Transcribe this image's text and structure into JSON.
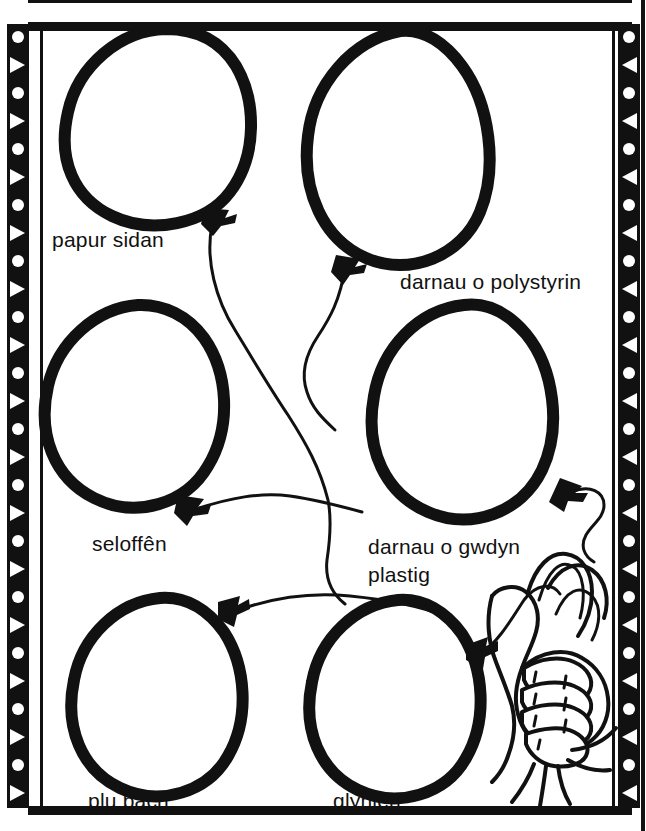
{
  "page": {
    "language": "cy",
    "background_color": "#ffffff",
    "ink_color": "#111111"
  },
  "frame": {
    "style": "decorative-film-strip",
    "left_band_pattern": [
      "circle",
      "triangle"
    ],
    "right_band_pattern": [
      "circle",
      "triangle"
    ],
    "band_cell_count": 28
  },
  "labels": {
    "papur_sidan": "papur sidan",
    "darnau_o_polystyrin": "darnau o polystyrin",
    "seloffen": "seloffên",
    "darnau_o_gwdyn": "darnau o gwdyn",
    "plastig": "plastig",
    "plu_bach": "plu bach",
    "glynlen": "glynlen"
  },
  "balloons": [
    {
      "id": "balloon-1",
      "label": "papur sidan",
      "row": 1,
      "col": 1
    },
    {
      "id": "balloon-2",
      "label": "darnau o polystyrin",
      "row": 1,
      "col": 2
    },
    {
      "id": "balloon-3",
      "label": "seloffên",
      "row": 2,
      "col": 1
    },
    {
      "id": "balloon-4",
      "label": "darnau o gwdyn plastig",
      "row": 2,
      "col": 2
    },
    {
      "id": "balloon-5",
      "label": "plu bach",
      "row": 3,
      "col": 1
    },
    {
      "id": "balloon-6",
      "label": "glynlen",
      "row": 3,
      "col": 2
    }
  ],
  "hand": {
    "name": "hand-holding-strings",
    "description": "hand gripping balloon strings",
    "position": "bottom-right"
  }
}
